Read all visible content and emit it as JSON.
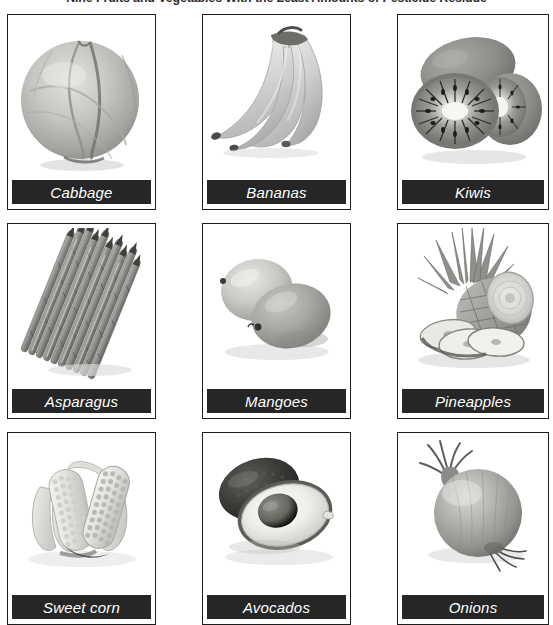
{
  "figure": {
    "title": "Nine Fruits and Vegetables With the Least Amounts of Pesticide Residue",
    "colors": {
      "caption_bar": "#262626",
      "caption_text": "#ffffff",
      "card_border": "#1d1d1d",
      "page_background": "#ffffff",
      "title_text": "#2b2b2b"
    },
    "layout": {
      "rows": 3,
      "columns": 3,
      "total_items": 9,
      "image_style": "grayscale-photo"
    }
  },
  "items": [
    {
      "caption": "Cabbage",
      "icon": "cabbage-photo",
      "row": 1,
      "column": 1
    },
    {
      "caption": "Bananas",
      "icon": "bananas-photo",
      "row": 1,
      "column": 2
    },
    {
      "caption": "Kiwis",
      "icon": "kiwis-photo",
      "row": 1,
      "column": 3
    },
    {
      "caption": "Asparagus",
      "icon": "asparagus-photo",
      "row": 2,
      "column": 1
    },
    {
      "caption": "Mangoes",
      "icon": "mangoes-photo",
      "row": 2,
      "column": 2
    },
    {
      "caption": "Pineapples",
      "icon": "pineapples-photo",
      "row": 2,
      "column": 3
    },
    {
      "caption": "Sweet corn",
      "icon": "sweetcorn-photo",
      "row": 3,
      "column": 1
    },
    {
      "caption": "Avocados",
      "icon": "avocados-photo",
      "row": 3,
      "column": 2
    },
    {
      "caption": "Onions",
      "icon": "onions-photo",
      "row": 3,
      "column": 3
    }
  ]
}
